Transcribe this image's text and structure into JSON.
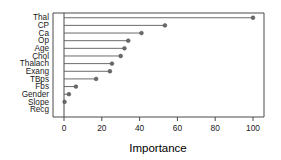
{
  "chart_data": {
    "type": "bar",
    "subtype": "horizontal-lollipop-dotplot",
    "title": "",
    "subtitle": "",
    "xlabel": "Importance",
    "ylabel": "",
    "categories": [
      "Thal",
      "CP",
      "Ca",
      "Op",
      "Age",
      "Chol",
      "Thalach",
      "Exang",
      "TBps",
      "Fbs",
      "Gender",
      "Slope",
      "Recg"
    ],
    "values": [
      100,
      53.4,
      41,
      34,
      32,
      30,
      25.4,
      24.3,
      17,
      6.3,
      2.6,
      0.3,
      0
    ],
    "series": [
      {
        "name": "Importance",
        "values": [
          100,
          53.4,
          41,
          34,
          32,
          30,
          25.4,
          24.3,
          17,
          6.3,
          2.6,
          0.3,
          0
        ]
      }
    ],
    "xlim": [
      -4,
      108
    ],
    "ylim": [
      0,
      13
    ],
    "xticks": [
      0,
      20,
      40,
      60,
      80,
      100
    ],
    "xticklabels": [
      "0",
      "20",
      "40",
      "60",
      "80",
      "100"
    ],
    "grid": false,
    "legend": false,
    "legend_position": "none",
    "orientation": "horizontal",
    "colors": {
      "point": "#6b6b6b",
      "stem": "#5a5a5a",
      "axis": "#4a4a4a",
      "text": "#1a1a1a",
      "background": "#ffffff"
    }
  }
}
